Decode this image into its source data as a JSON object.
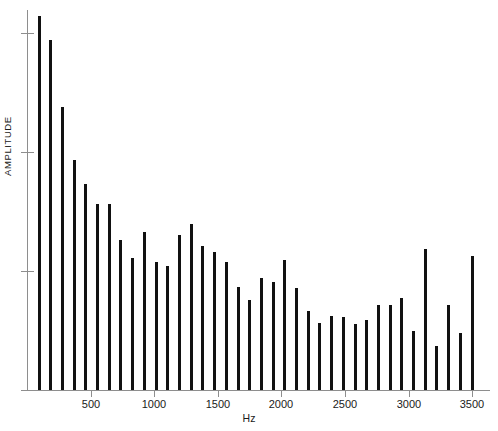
{
  "figure": {
    "background_color": "#ffffff",
    "axis_color": "#8e8e8e",
    "bar_color": "#111111",
    "text_color": "#1a1a1a"
  },
  "axes": {
    "x_title": "Hz",
    "y_title": "AMPLITUDE",
    "x_tick_labels": [
      "500",
      "1000",
      "1500",
      "2000",
      "2500",
      "3000",
      "3500"
    ],
    "x_tick_values": [
      500,
      1000,
      1500,
      2000,
      2500,
      3000,
      3500
    ],
    "y_tick_count": 4
  },
  "chart_data": {
    "type": "bar",
    "title": "",
    "subtitle": "",
    "xlabel": "Hz",
    "ylabel": "AMPLITUDE",
    "xlim": [
      0,
      3640
    ],
    "ylim": [
      0,
      1.0
    ],
    "grid": false,
    "legend": null,
    "annotations": [],
    "x": [
      95,
      187,
      279,
      371,
      463,
      555,
      647,
      739,
      831,
      923,
      1015,
      1107,
      1199,
      1291,
      1383,
      1475,
      1567,
      1659,
      1751,
      1843,
      1935,
      2027,
      2119,
      2211,
      2303,
      2395,
      2487,
      2579,
      2671,
      2763,
      2855,
      2947,
      3039,
      3131,
      3223,
      3315,
      3407,
      3499,
      3591
    ],
    "categories": [
      "95",
      "187",
      "279",
      "371",
      "463",
      "555",
      "647",
      "739",
      "831",
      "923",
      "1015",
      "1107",
      "1199",
      "1291",
      "1383",
      "1475",
      "1567",
      "1659",
      "1751",
      "1843",
      "1935",
      "2027",
      "2119",
      "2211",
      "2303",
      "2395",
      "2487",
      "2579",
      "2671",
      "2763",
      "2855",
      "2947",
      "3039",
      "3131",
      "3223",
      "3315",
      "3407",
      "3499",
      "3591"
    ],
    "values": [
      0.984,
      0.921,
      0.745,
      0.605,
      0.542,
      0.49,
      0.489,
      0.395,
      0.348,
      0.415,
      0.337,
      0.326,
      0.408,
      0.437,
      0.379,
      0.363,
      0.336,
      0.271,
      0.236,
      0.296,
      0.283,
      0.342,
      0.268,
      0.207,
      0.176,
      0.195,
      0.192,
      0.174,
      0.184,
      0.223,
      0.223,
      0.242,
      0.156,
      0.371,
      0.116,
      0.224,
      0.15,
      0.352,
      0.0
    ],
    "ylabel_ticks_visible": false
  }
}
